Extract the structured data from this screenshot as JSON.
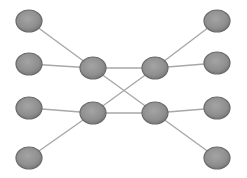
{
  "diagram": {
    "type": "network-graph",
    "width": 247,
    "height": 178,
    "colors": {
      "background": "#ffffff",
      "node_fill": "#8e8e8e",
      "node_stroke": "#6a6a6a",
      "node_highlight": "#a6a6a6",
      "edge": "#a8a8a8"
    },
    "node_radius_x": 13,
    "node_radius_y": 11,
    "nodes": [
      {
        "id": "L1",
        "x": 29,
        "y": 21
      },
      {
        "id": "L2",
        "x": 29,
        "y": 64
      },
      {
        "id": "L3",
        "x": 29,
        "y": 108
      },
      {
        "id": "L4",
        "x": 29,
        "y": 158
      },
      {
        "id": "IL1",
        "x": 93,
        "y": 68
      },
      {
        "id": "IL2",
        "x": 93,
        "y": 113
      },
      {
        "id": "IR1",
        "x": 155,
        "y": 68
      },
      {
        "id": "IR2",
        "x": 155,
        "y": 113
      },
      {
        "id": "R1",
        "x": 217,
        "y": 21
      },
      {
        "id": "R2",
        "x": 217,
        "y": 63
      },
      {
        "id": "R3",
        "x": 217,
        "y": 108
      },
      {
        "id": "R4",
        "x": 217,
        "y": 158
      }
    ],
    "edges": [
      {
        "from": "L1",
        "to": "IL1"
      },
      {
        "from": "L2",
        "to": "IL1"
      },
      {
        "from": "L3",
        "to": "IL2"
      },
      {
        "from": "L4",
        "to": "IL2"
      },
      {
        "from": "IL1",
        "to": "IR1"
      },
      {
        "from": "IL2",
        "to": "IR2"
      },
      {
        "from": "IL1",
        "to": "IR2"
      },
      {
        "from": "IL2",
        "to": "IR1"
      },
      {
        "from": "IR1",
        "to": "R1"
      },
      {
        "from": "IR1",
        "to": "R2"
      },
      {
        "from": "IR2",
        "to": "R3"
      },
      {
        "from": "IR2",
        "to": "R4"
      }
    ]
  }
}
